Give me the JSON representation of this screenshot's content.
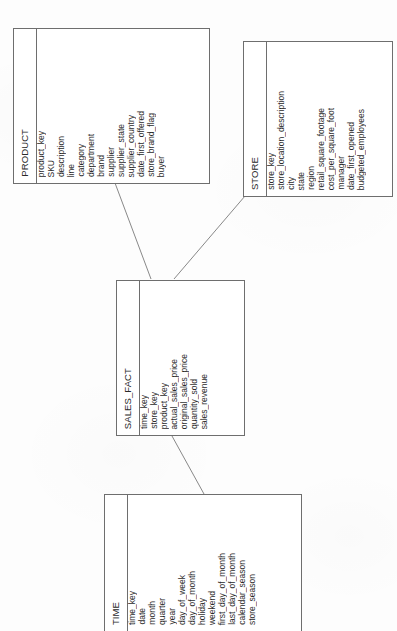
{
  "diagram": {
    "type": "entity-relationship-diagram",
    "orientation": "rotated-90-ccw",
    "line_color": "#6e6e6e",
    "text_color": "#2a2a2a",
    "background_color": "#ffffff"
  },
  "entities": {
    "product": {
      "name": "PRODUCT",
      "fields": [
        "product_key",
        "SKU",
        "description",
        "line",
        "category",
        "department",
        "brand",
        "supplier",
        "supplier_state",
        "supplier_country",
        "date_first_offered",
        "store_brand_flag",
        "buyer"
      ]
    },
    "store": {
      "name": "STORE",
      "fields": [
        "store_key",
        "store_location_description",
        "city",
        "state",
        "region",
        "retail_square_footage",
        "cost_per_square_foot",
        "manager",
        "date_first_opened",
        "budgeted_employees"
      ]
    },
    "sales_fact": {
      "name": "SALES_FACT",
      "fields": [
        "time_key",
        "store_key",
        "product_key",
        "actual_sales_price",
        "original_sales_price",
        "quantity_sold",
        "sales_revenue"
      ]
    },
    "time": {
      "name": "TIME",
      "fields": [
        "time_key",
        "date",
        "month",
        "quarter",
        "year",
        "day_of_week",
        "day_of_month",
        "holiday",
        "weekend",
        "first_day_of_month",
        "last_day_of_month",
        "calendar_season",
        "store_season"
      ]
    }
  },
  "relationships": [
    {
      "from": "product",
      "to": "sales_fact"
    },
    {
      "from": "store",
      "to": "sales_fact"
    },
    {
      "from": "time",
      "to": "sales_fact"
    }
  ]
}
